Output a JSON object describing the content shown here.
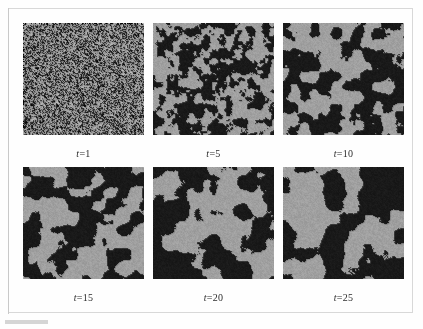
{
  "figure": {
    "type": "simulation-snapshot-grid",
    "rows": 2,
    "columns": 3,
    "background_color": "#fefefe",
    "frame_color": "#d8d8d8",
    "mark_color": "#d5d5d5"
  },
  "palette": {
    "dark_phase": "#1a1a1a",
    "light_phase": "#a0a0a0",
    "panel_background": "#a0a0a0",
    "label_color": "#2b2b2b"
  },
  "chart_data": {
    "type": "heatmap",
    "title": "",
    "xlabel": "",
    "ylabel": "",
    "grid": false,
    "legend_position": "none",
    "series": [
      {
        "name": "t = 1",
        "time": 1,
        "label": "t =1",
        "variable": "t",
        "equals": "=",
        "value": "1",
        "domain_scale_px": 1.6,
        "dark_fraction": 0.5,
        "seed": 1201,
        "roughness": 0.96,
        "octaves": 5
      },
      {
        "name": "t = 5",
        "time": 5,
        "label": "t =5",
        "variable": "t",
        "equals": "=",
        "value": "5",
        "domain_scale_px": 7.5,
        "dark_fraction": 0.49,
        "seed": 2417,
        "roughness": 0.52,
        "octaves": 4
      },
      {
        "name": "t = 10",
        "time": 10,
        "label": "t =10",
        "variable": "t",
        "equals": "=",
        "value": "10",
        "domain_scale_px": 10.5,
        "dark_fraction": 0.5,
        "seed": 3319,
        "roughness": 0.42,
        "octaves": 4
      },
      {
        "name": "t = 15",
        "time": 15,
        "label": "t =15",
        "variable": "t",
        "equals": "=",
        "value": "15",
        "domain_scale_px": 12.5,
        "dark_fraction": 0.5,
        "seed": 4703,
        "roughness": 0.36,
        "octaves": 4
      },
      {
        "name": "t = 20",
        "time": 20,
        "label": "t =20",
        "variable": "t",
        "equals": "=",
        "value": "20",
        "domain_scale_px": 15.0,
        "dark_fraction": 0.51,
        "seed": 5821,
        "roughness": 0.32,
        "octaves": 4
      },
      {
        "name": "t = 25",
        "time": 25,
        "label": "t =25",
        "variable": "t",
        "equals": "=",
        "value": "25",
        "domain_scale_px": 17.0,
        "dark_fraction": 0.5,
        "seed": 6967,
        "roughness": 0.3,
        "octaves": 4
      }
    ],
    "panel_labels": [
      "t =1",
      "t =5",
      "t =10",
      "t =15",
      "t =20",
      "t =25"
    ],
    "times": [
      1,
      5,
      10,
      15,
      20,
      25
    ]
  }
}
